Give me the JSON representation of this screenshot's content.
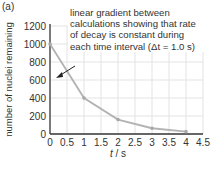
{
  "panel_label": "(a)",
  "annotation": {
    "lines": [
      "linear gradient between",
      "calculations showing that rate",
      "of decay is constant during",
      "each time interval (Δt = 1.0 s)"
    ]
  },
  "chart_data": {
    "type": "line",
    "title": "",
    "xlabel": "t / s",
    "ylabel": "number of nuclei remaining",
    "x": [
      0,
      1,
      2,
      3,
      4
    ],
    "series": [
      {
        "name": "nuclei remaining",
        "values": [
          1000,
          400,
          160,
          64,
          26
        ]
      }
    ],
    "xlim": [
      0,
      4.5
    ],
    "ylim": [
      0,
      1200
    ],
    "xticks": [
      "0",
      "0.5",
      "1",
      "1.5",
      "2",
      "2.5",
      "3",
      "3.5",
      "4",
      "4.5"
    ],
    "yticks": [
      "0",
      "200",
      "400",
      "600",
      "800",
      "1000",
      "1200"
    ],
    "grid": true,
    "legend": "none",
    "annotations": [
      {
        "text": "linear gradient between calculations showing that rate of decay is constant during each time interval (Δt = 1.0 s)",
        "arrow_to": [
          0.7,
          640
        ]
      }
    ],
    "colors": {
      "line": "#b3b3b3",
      "grid": "#e3e3e3",
      "axis": "#333333"
    }
  },
  "axes": {
    "xlabel_italic": "t",
    "xlabel_unit": " / s"
  }
}
